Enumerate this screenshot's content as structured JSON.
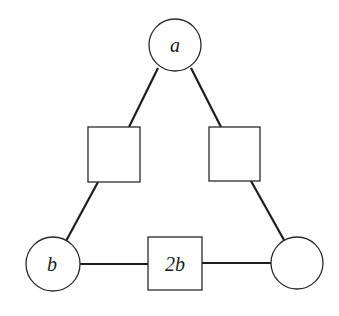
{
  "diagram": {
    "type": "magic-triangle-puzzle",
    "colors": {
      "background": "#ffffff",
      "stroke": "#1e1e1e"
    },
    "nodes": [
      {
        "id": "circle-top",
        "shape": "circle",
        "label": "a",
        "cx": 175,
        "cy": 45,
        "r": 26
      },
      {
        "id": "square-left",
        "shape": "square",
        "label": "",
        "x": 88,
        "y": 127,
        "w": 52,
        "h": 55
      },
      {
        "id": "square-right",
        "shape": "square",
        "label": "",
        "x": 209,
        "y": 127,
        "w": 51,
        "h": 54
      },
      {
        "id": "circle-bottom-left",
        "shape": "circle",
        "label": "b",
        "cx": 53,
        "cy": 264,
        "r": 27
      },
      {
        "id": "square-bottom",
        "shape": "square",
        "label": "2b",
        "x": 148,
        "y": 237,
        "w": 54,
        "h": 53
      },
      {
        "id": "circle-bottom-right",
        "shape": "circle",
        "label": "",
        "cx": 297,
        "cy": 263,
        "r": 26
      }
    ],
    "edges": [
      {
        "from": "circle-top",
        "to": "square-left"
      },
      {
        "from": "circle-top",
        "to": "square-right"
      },
      {
        "from": "square-left",
        "to": "circle-bottom-left"
      },
      {
        "from": "square-right",
        "to": "circle-bottom-right"
      },
      {
        "from": "circle-bottom-left",
        "to": "square-bottom"
      },
      {
        "from": "square-bottom",
        "to": "circle-bottom-right"
      }
    ]
  }
}
